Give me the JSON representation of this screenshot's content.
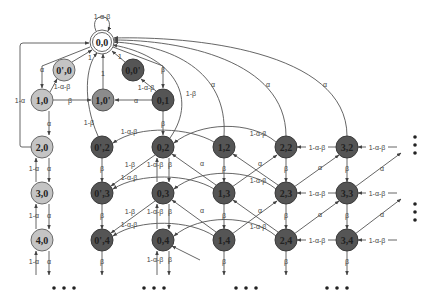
{
  "diagram": {
    "type": "state-transition-diagram",
    "colors": {
      "start": "#ffffff",
      "light": "#c4c4c4",
      "medium": "#8c8c8c",
      "dark": "#555555",
      "edge": "#555555"
    },
    "nodes": {
      "n00": "0,0",
      "n0p0": "0',0",
      "n00p": "0,0'",
      "n10": "1,0",
      "n10p": "1,0'",
      "n01": "0,1",
      "n20": "2,0",
      "n30": "3,0",
      "n40": "4,0",
      "n0p2": "0',2",
      "n0p3": "0',3",
      "n0p4": "0',4",
      "n02": "0,2",
      "n03": "0,3",
      "n04": "0,4",
      "n12": "1,2",
      "n13": "1,3",
      "n14": "1,4",
      "n22": "2,2",
      "n23": "2,3",
      "n24": "2,4",
      "n32": "3,2",
      "n33": "3,3",
      "n34": "3,4"
    },
    "labels": {
      "self_loop_00": "1-α-β",
      "a_00_10": "α",
      "one_minus_a_20_00": "1-α",
      "one_0p0_00": "1",
      "one_minus_ab_10_0p0": "1-α-β",
      "beta_10_10p": "β",
      "one_10p_00": "1",
      "alpha_01_10p": "α",
      "one_00p_00": "1",
      "one_minus_ab_01_00p": "1-α-β",
      "beta_00_01": "β",
      "alpha_10_20": "α",
      "beta_01_02": "β",
      "one_minus_b_0p2_00": "1-β",
      "one_minus_b_02_00": "1-β",
      "alpha_12_00": "α",
      "alpha_22_00": "α",
      "alpha_32_00": "α",
      "one_minus_ab_12_0p2": "1-α-β",
      "one_minus_ab_22_02": "1-α-β",
      "one_minus_a": "1-α",
      "alpha": "α",
      "beta": "β",
      "one_minus_b": "1-β",
      "one_minus_ab": "1-α-β"
    },
    "continuation_marks": {
      "bottom_left": "• • •",
      "bottom_mid": "• • •",
      "bottom_right_a": "• • •",
      "bottom_right_b": "• • •"
    }
  }
}
